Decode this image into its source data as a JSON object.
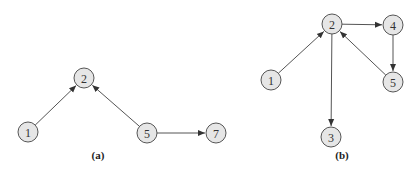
{
  "diagrams": [
    {
      "id": "a",
      "caption": "(a)",
      "caption_pos": [
        98,
        155
      ],
      "node_radius": 10,
      "nodes": [
        {
          "label": "1",
          "x": 28,
          "y": 132
        },
        {
          "label": "2",
          "x": 84,
          "y": 78
        },
        {
          "label": "5",
          "x": 147,
          "y": 133
        },
        {
          "label": "7",
          "x": 216,
          "y": 133
        }
      ],
      "edges": [
        {
          "from": "1",
          "to": "2"
        },
        {
          "from": "5",
          "to": "2"
        },
        {
          "from": "5",
          "to": "7"
        }
      ]
    },
    {
      "id": "b",
      "caption": "(b)",
      "caption_pos": [
        342,
        155
      ],
      "node_radius": 10,
      "nodes": [
        {
          "label": "1",
          "x": 271,
          "y": 80
        },
        {
          "label": "2",
          "x": 332,
          "y": 24
        },
        {
          "label": "3",
          "x": 331,
          "y": 137
        },
        {
          "label": "4",
          "x": 393,
          "y": 25
        },
        {
          "label": "5",
          "x": 393,
          "y": 82
        }
      ],
      "edges": [
        {
          "from": "1",
          "to": "2"
        },
        {
          "from": "2",
          "to": "4"
        },
        {
          "from": "2",
          "to": "3"
        },
        {
          "from": "4",
          "to": "5"
        },
        {
          "from": "5",
          "to": "2"
        }
      ]
    }
  ],
  "colors": {
    "node_fill": "#e6e6e6",
    "node_stroke": "#555555",
    "edge": "#555555",
    "text": "#333333"
  }
}
